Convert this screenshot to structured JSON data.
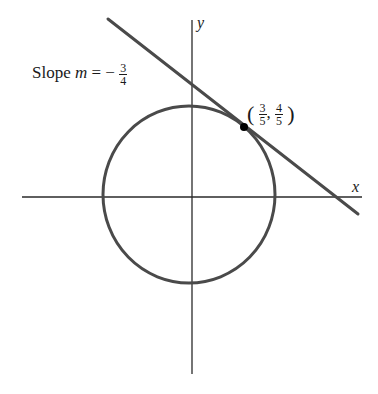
{
  "figure": {
    "axes": {
      "x_label": "x",
      "y_label": "y"
    },
    "slope_label": {
      "prefix": "Slope ",
      "variable": "m",
      "equals": " = −",
      "numerator": "3",
      "denominator": "4"
    },
    "point_label": {
      "open": "(",
      "x_numerator": "3",
      "x_denominator": "5",
      "separator": ",",
      "y_numerator": "4",
      "y_denominator": "5",
      "close": ")"
    },
    "colors": {
      "curve": "#4a4a4a",
      "axis": "#2a2a2a",
      "point": "#000000"
    }
  }
}
